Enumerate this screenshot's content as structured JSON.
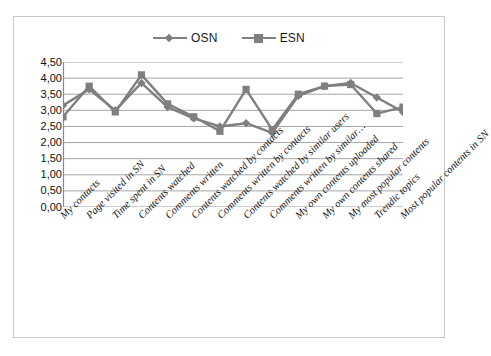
{
  "chart_data": {
    "type": "line",
    "title": "",
    "xlabel": "",
    "ylabel": "",
    "ylim": [
      0,
      4.5
    ],
    "grid": "horizontal",
    "legend_position": "top-center",
    "y_ticks": [
      "0,00",
      "0,50",
      "1,00",
      "1,50",
      "2,00",
      "2,50",
      "3,00",
      "3,50",
      "4,00",
      "4,50"
    ],
    "y_tick_values": [
      0,
      0.5,
      1,
      1.5,
      2,
      2.5,
      3,
      3.5,
      4,
      4.5
    ],
    "decimal_separator": ",",
    "categories": [
      "My contacts",
      "Page visited in SN",
      "Time spent in SN",
      "Contents watched",
      "Comments written",
      "Contents watched by contacts",
      "Comments written by contacts",
      "Contents watched by similar users",
      "Comments  written by similar…",
      "My own contents uploaded",
      "My own contents shared",
      "My most popular contents",
      "Trendic topics",
      "Most popular contents in SN"
    ],
    "series": [
      {
        "name": "OSN",
        "marker": "diamond",
        "color": "#7f7f7f",
        "values": [
          3.15,
          3.65,
          3.0,
          3.85,
          3.1,
          2.75,
          2.5,
          2.6,
          2.3,
          3.45,
          3.75,
          3.85,
          3.4,
          2.95
        ]
      },
      {
        "name": "ESN",
        "marker": "square",
        "color": "#7f7f7f",
        "values": [
          2.8,
          3.75,
          2.95,
          4.1,
          3.2,
          2.8,
          2.35,
          3.65,
          2.4,
          3.5,
          3.75,
          3.8,
          2.9,
          3.1
        ]
      }
    ]
  },
  "legend": {
    "entries": [
      {
        "label": "OSN",
        "marker": "diamond"
      },
      {
        "label": "ESN",
        "marker": "square"
      }
    ]
  },
  "colors": {
    "series": "#7f7f7f",
    "gridline": "#9b9b9b",
    "axis": "#8a8a8a",
    "frame_border": "#c9c9c9",
    "text": "#111111"
  }
}
